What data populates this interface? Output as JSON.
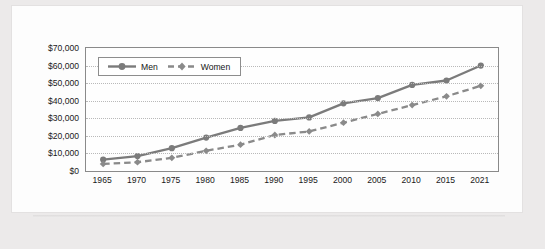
{
  "chart_data": {
    "type": "line",
    "title": "",
    "xlabel": "",
    "ylabel": "",
    "categories": [
      "1965",
      "1970",
      "1975",
      "1980",
      "1985",
      "1990",
      "1995",
      "2000",
      "2005",
      "2010",
      "2015",
      "2021"
    ],
    "ylim": [
      0,
      70000
    ],
    "ytick_labels": [
      "$0",
      "$10,000",
      "$20,000",
      "$30,000",
      "$40,000",
      "$50,000",
      "$60,000",
      "$70,000"
    ],
    "ytick_values": [
      0,
      10000,
      20000,
      30000,
      40000,
      50000,
      60000,
      70000
    ],
    "grid": true,
    "legend_position": "top-left",
    "series": [
      {
        "name": "Men",
        "line_style": "solid",
        "marker": "circle",
        "color": "#7b7b7b",
        "values": [
          6500,
          8500,
          13000,
          19000,
          24500,
          28500,
          30500,
          38500,
          41500,
          49000,
          51500,
          60000
        ]
      },
      {
        "name": "Women",
        "line_style": "dashed",
        "marker": "diamond",
        "color": "#8a8a8a",
        "values": [
          4000,
          5000,
          7500,
          11500,
          15000,
          20500,
          22500,
          27500,
          32500,
          37500,
          42500,
          48500
        ]
      }
    ]
  },
  "legend": {
    "men_label": "Men",
    "women_label": "Women"
  },
  "colors": {
    "page_background": "#eceaea",
    "card_background": "#fdfdfd",
    "plot_border": "#8a8a8a",
    "gridline": "#b9b9b9",
    "series_men": "#7b7b7b",
    "series_women": "#8a8a8a",
    "text": "#1a1a1a"
  }
}
